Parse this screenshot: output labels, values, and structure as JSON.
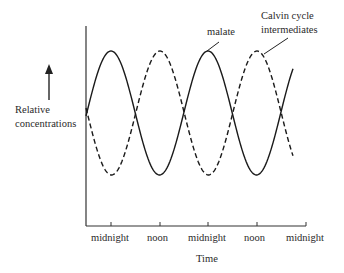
{
  "chart_data": {
    "type": "line",
    "title": "",
    "xlabel": "Time",
    "ylabel": "Relative concentrations",
    "x_ticks": [
      "midnight",
      "noon",
      "midnight",
      "noon",
      "midnight"
    ],
    "grid": false,
    "series": [
      {
        "name": "malate",
        "style": "solid",
        "description": "peaks at midnight, minimum at noon",
        "x": [
          "start",
          "midnight",
          "noon",
          "midnight",
          "noon",
          "end"
        ],
        "values": [
          0.5,
          1.0,
          0.0,
          1.0,
          0.0,
          0.87
        ]
      },
      {
        "name": "Calvin cycle intermediates",
        "style": "dashed",
        "description": "peaks at noon, minimum at midnight",
        "x": [
          "start",
          "midnight",
          "noon",
          "midnight",
          "noon",
          "end"
        ],
        "values": [
          0.5,
          0.0,
          1.0,
          0.0,
          1.0,
          0.13
        ]
      }
    ]
  },
  "labels": {
    "ylabel_line1": "Relative",
    "ylabel_line2": "concentrations",
    "xlabel": "Time",
    "malate": "malate",
    "calvin_line1": "Calvin cycle",
    "calvin_line2": "intermediates",
    "ticks": [
      "midnight",
      "noon",
      "midnight",
      "noon",
      "midnight"
    ]
  }
}
